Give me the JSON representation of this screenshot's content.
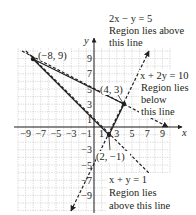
{
  "chart_data": {
    "type": "line",
    "title": "",
    "xlabel": "x",
    "ylabel": "y",
    "xlim": [
      -10,
      10
    ],
    "ylim": [
      -11,
      11
    ],
    "grid": true,
    "x_tick_labels": [
      "-9",
      "-7",
      "-5",
      "-3",
      "-1",
      "1",
      "3",
      "5",
      "7",
      "9"
    ],
    "y_tick_labels": [
      "9",
      "7",
      "5",
      "3",
      "1",
      "-3",
      "-5",
      "-7",
      "-9"
    ],
    "series": [
      {
        "name": "2x - y = 5",
        "style": "dashed",
        "equation": "y = 2x - 5",
        "x": [
          -3,
          8
        ],
        "y": [
          -11,
          11
        ],
        "annotation": [
          "2x − y = 5",
          "Region lies above",
          "this line"
        ]
      },
      {
        "name": "x + 2y = 10",
        "style": "dashed",
        "equation": "y = (10 - x) / 2",
        "x": [
          -10,
          10
        ],
        "y": [
          10,
          0
        ],
        "annotation": [
          "x + 2y = 10",
          "Region lies",
          "below",
          "this line"
        ]
      },
      {
        "name": "x + y = 1",
        "style": "dashed",
        "equation": "y = 1 - x",
        "x": [
          -10,
          10
        ],
        "y": [
          11,
          -9
        ],
        "annotation": [
          "x + y = 1",
          "Region lies",
          "above this line"
        ]
      },
      {
        "name": "feasible-region-boundary",
        "style": "solid",
        "x": [
          -8,
          4,
          2,
          -8
        ],
        "y": [
          9,
          3,
          -1,
          9
        ]
      }
    ],
    "vertices": [
      {
        "label": "(−8, 9)",
        "x": -8,
        "y": 9
      },
      {
        "label": "(4, 3)",
        "x": 4,
        "y": 3
      },
      {
        "label": "(2, −1)",
        "x": 2,
        "y": -1
      }
    ]
  },
  "axes": {
    "x_label": "x",
    "y_label": "y"
  },
  "annotations": {
    "line1": [
      "2x − y = 5",
      "Region lies above",
      "this line"
    ],
    "line2": [
      "x + 2y = 10",
      "Region lies",
      "below",
      "this line"
    ],
    "line3": [
      "x + y = 1",
      "Region lies",
      "above this line"
    ]
  },
  "vertex_labels": {
    "a": "(−8, 9)",
    "b": "(4, 3)",
    "c": "(2, −1)"
  },
  "ticks": {
    "x": [
      "−9",
      "−7",
      "−5",
      "−3",
      "−1",
      "1",
      "3",
      "5",
      "7",
      "9"
    ],
    "y": [
      "9",
      "7",
      "5",
      "3",
      "1",
      "−3",
      "−5",
      "−7",
      "−9"
    ]
  },
  "colors": {
    "ink": "#231f20",
    "grid": "#b9b9b9",
    "background": "#ffffff"
  }
}
